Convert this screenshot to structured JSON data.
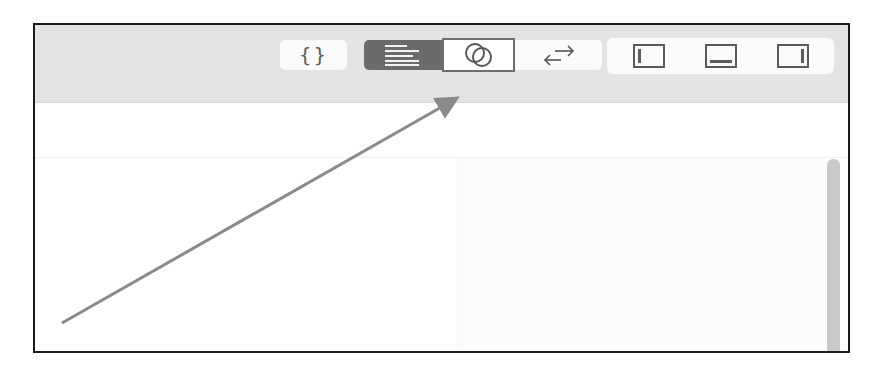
{
  "toolbar": {
    "json_button": {
      "label": "{}",
      "icon": "curly-braces-icon"
    },
    "view_mode_group": {
      "buttons": [
        {
          "name": "text-lines",
          "icon": "text-lines-icon",
          "selected": true
        },
        {
          "name": "overlap-circles",
          "icon": "overlapping-circles-icon",
          "selected": false,
          "highlighted": true
        },
        {
          "name": "swap",
          "label": "←→",
          "icon": "swap-arrows-icon",
          "selected": false
        }
      ]
    },
    "layout_group": {
      "buttons": [
        {
          "name": "left-panel",
          "icon": "left-panel-icon"
        },
        {
          "name": "bottom-panel",
          "icon": "bottom-panel-icon"
        },
        {
          "name": "right-panel",
          "icon": "right-panel-icon"
        }
      ]
    }
  },
  "annotation": {
    "type": "arrow",
    "color": "#8a8a8a",
    "from": [
      62,
      323
    ],
    "to": [
      460,
      96
    ],
    "target": "overlap-circles"
  },
  "colors": {
    "toolbar_bg": "#e3e3e3",
    "selected_segment": "#6b6b6b",
    "frame_border": "#1a1a1a",
    "scrollbar": "#c9c9c9"
  }
}
